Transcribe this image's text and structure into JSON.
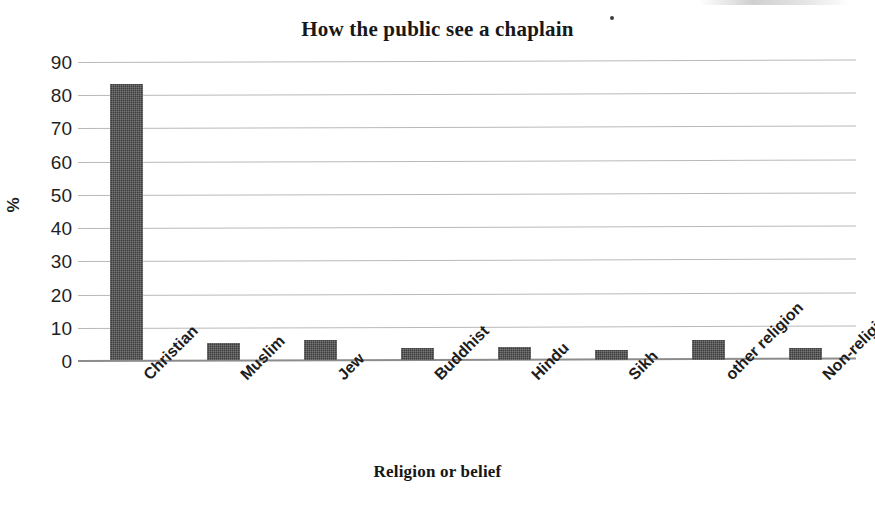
{
  "chart_data": {
    "type": "bar",
    "title": "How the public see a chaplain",
    "xlabel": "Religion or belief",
    "ylabel": "%",
    "categories": [
      "Christian",
      "Muslim",
      "Jew",
      "Buddhist",
      "Hindu",
      "Sikh",
      "other religion",
      "Non-religious"
    ],
    "values": [
      83,
      5,
      6,
      3.5,
      4,
      3,
      6,
      3.5
    ],
    "ylim": [
      0,
      90
    ],
    "ytick_labels": [
      "90",
      "80",
      "70",
      "60",
      "50",
      "40",
      "30",
      "20",
      "10",
      "0"
    ],
    "ytick_values": [
      90,
      80,
      70,
      60,
      50,
      40,
      30,
      20,
      10,
      0
    ],
    "grid": true,
    "legend": "none",
    "bar_color": "#3c3c3c",
    "grid_color": "#b9b9b9",
    "axis_color": "#8c8c8c",
    "text_color": "#1f1f1f"
  }
}
